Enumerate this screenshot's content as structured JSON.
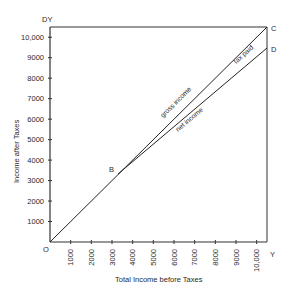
{
  "chart_data": {
    "type": "line",
    "title": "",
    "xlabel": "Total Income before Taxes",
    "ylabel": "Income after Taxes",
    "xlim": [
      0,
      10500
    ],
    "ylim": [
      0,
      10500
    ],
    "x_ticks": [
      "1000",
      "2000",
      "3000",
      "4000",
      "5000",
      "6000",
      "7000",
      "8000",
      "9000",
      "10,000"
    ],
    "y_ticks": [
      "1000",
      "2000",
      "3000",
      "4000",
      "5000",
      "6000",
      "7000",
      "8000",
      "9000",
      "10,000"
    ],
    "grid": false,
    "series": [
      {
        "name": "gross income",
        "x": [
          0,
          3000,
          10500
        ],
        "y": [
          0,
          3000,
          10500
        ]
      },
      {
        "name": "net income",
        "x": [
          0,
          3000,
          10500
        ],
        "y": [
          0,
          3000,
          9800
        ]
      }
    ],
    "annotations": [
      {
        "text": "O",
        "x": 0,
        "y": 0
      },
      {
        "text": "B",
        "x": 3000,
        "y": 3000
      },
      {
        "text": "C",
        "x": 10500,
        "y": 10500
      },
      {
        "text": "D",
        "x": 10500,
        "y": 9800
      },
      {
        "text": "DY",
        "x": 0,
        "y": 10500
      },
      {
        "text": "Y",
        "x": 10500,
        "y": 0
      },
      {
        "text": "tax paid",
        "between": [
          "gross income",
          "net income"
        ]
      }
    ]
  },
  "labels": {
    "origin": "O",
    "b": "B",
    "c": "C",
    "d": "D",
    "dy": "DY",
    "y": "Y",
    "gross_income": "gross income",
    "net_income": "net income",
    "tax_paid": "tax paid",
    "xlabel": "Total Income before Taxes",
    "ylabel": "Income after Taxes"
  }
}
